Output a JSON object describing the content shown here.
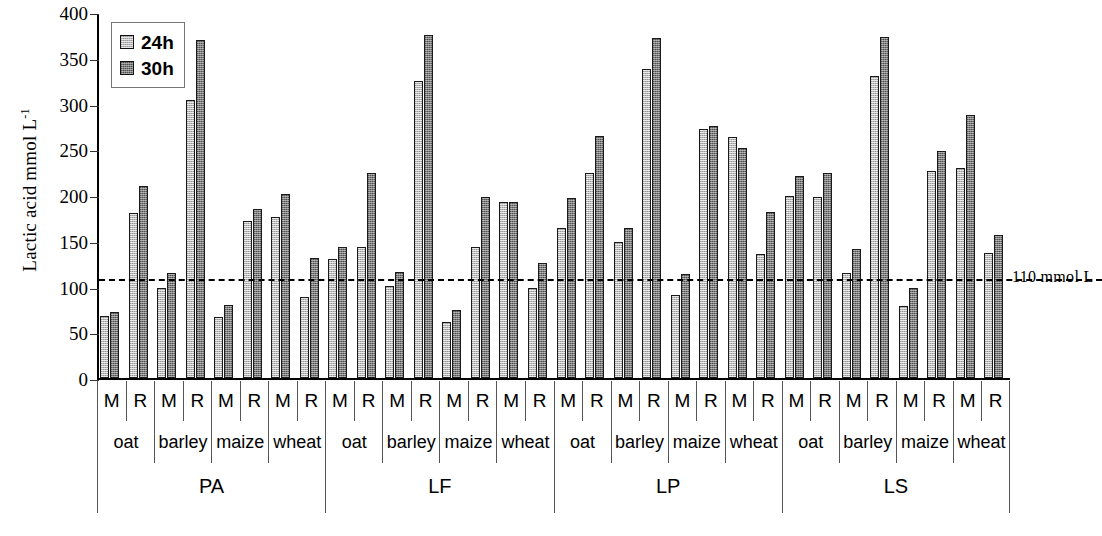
{
  "chart_data": {
    "type": "bar",
    "title": "",
    "xlabel": "",
    "ylabel": "Lactic acid mmol L",
    "ylabel_sup": "-1",
    "ylim": [
      0,
      400
    ],
    "yticks": [
      0,
      50,
      100,
      150,
      200,
      250,
      300,
      350,
      400
    ],
    "grid": false,
    "legend_position": "top-left",
    "legend": [
      "24h",
      "30h"
    ],
    "series": [
      {
        "name": "24h",
        "values": [
          68,
          180,
          98,
          304,
          67,
          172,
          176,
          88,
          130,
          143,
          101,
          325,
          61,
          143,
          192,
          98,
          164,
          224,
          149,
          338,
          91,
          272,
          263,
          135,
          199,
          198,
          115,
          330,
          79,
          226,
          229,
          137
        ]
      },
      {
        "name": "30h",
        "values": [
          72,
          210,
          115,
          369,
          80,
          185,
          201,
          131,
          143,
          224,
          116,
          375,
          74,
          198,
          192,
          126,
          197,
          265,
          164,
          372,
          114,
          275,
          251,
          181,
          221,
          224,
          141,
          373,
          98,
          248,
          287,
          156
        ]
      }
    ],
    "x_levels": {
      "sample": [
        "M",
        "R",
        "M",
        "R",
        "M",
        "R",
        "M",
        "R",
        "M",
        "R",
        "M",
        "R",
        "M",
        "R",
        "M",
        "R",
        "M",
        "R",
        "M",
        "R",
        "M",
        "R",
        "M",
        "R",
        "M",
        "R",
        "M",
        "R",
        "M",
        "R",
        "M",
        "R"
      ],
      "grain": [
        "oat",
        "barley",
        "maize",
        "wheat",
        "oat",
        "barley",
        "maize",
        "wheat",
        "oat",
        "barley",
        "maize",
        "wheat",
        "oat",
        "barley",
        "maize",
        "wheat"
      ],
      "treatment": [
        "PA",
        "LF",
        "LP",
        "LS"
      ]
    },
    "annotations": [
      {
        "name": "threshold",
        "value": 110,
        "text": "110 mmol L",
        "style": "dashed"
      }
    ],
    "colors": {
      "series_24h": "#b9b9b9",
      "series_30h": "#7b7b7b",
      "bar_outline": "#1a1a1a",
      "axis": "#000000",
      "background": "#ffffff"
    }
  }
}
